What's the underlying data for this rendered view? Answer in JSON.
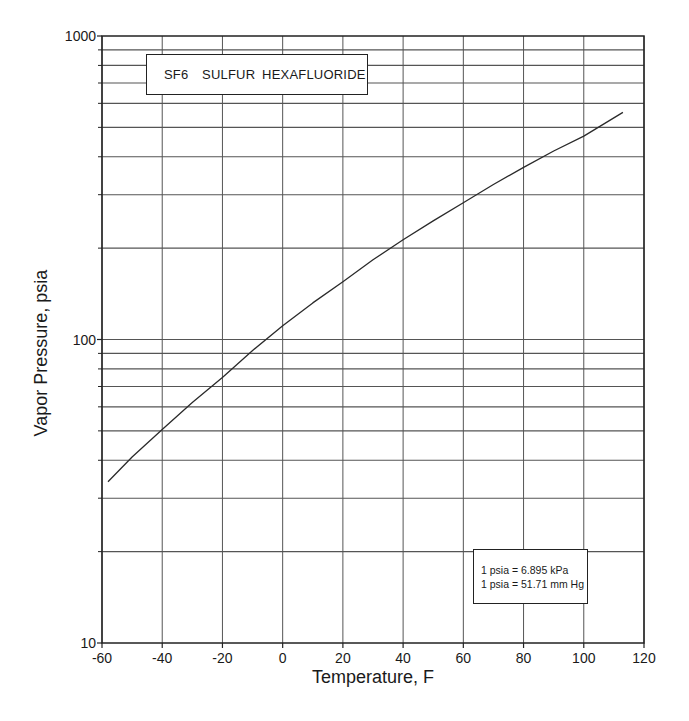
{
  "chart_data": {
    "type": "line",
    "title": "SF6  SULFUR HEXAFLUORIDE",
    "xlabel": "Temperature, F",
    "ylabel": "Vapor Pressure, psia",
    "xlim": [
      -60,
      120
    ],
    "ylim": [
      10,
      1000
    ],
    "yscale": "log",
    "grid": true,
    "x_ticks": [
      "-60",
      "-40",
      "-20",
      "0",
      "20",
      "40",
      "60",
      "80",
      "100",
      "120"
    ],
    "y_ticks": [
      "10",
      "100",
      "1000"
    ],
    "series": [
      {
        "name": "SF6 vapor pressure",
        "x": [
          -58,
          -50,
          -40,
          -30,
          -20,
          -10,
          0,
          10,
          20,
          30,
          40,
          50,
          60,
          70,
          80,
          90,
          100,
          113
        ],
        "y": [
          34,
          41,
          50.5,
          62,
          75,
          92,
          111,
          132,
          155,
          183,
          213,
          246,
          282,
          324,
          369,
          418,
          468,
          560
        ]
      }
    ],
    "annotations": [
      "1 psia = 6.895 kPa",
      "1 psia = 51.71 mm Hg"
    ]
  },
  "title_box": {
    "text": "SF6  SULFUR HEXAFLUORIDE"
  },
  "conversion_box": {
    "line1": "1 psia = 6.895 kPa",
    "line2": "1 psia = 51.71 mm Hg"
  },
  "axes": {
    "x_title": "Temperature, F",
    "y_title": "Vapor Pressure, psia"
  },
  "colors": {
    "grid": "#555555",
    "axis": "#222222",
    "curve": "#2a2a2a",
    "background": "#ffffff"
  }
}
